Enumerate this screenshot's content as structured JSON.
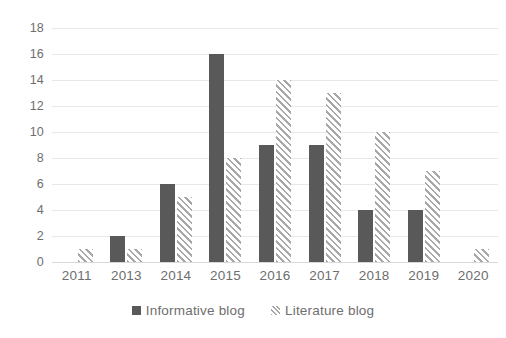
{
  "chart_data": {
    "type": "bar",
    "title": "",
    "xlabel": "",
    "ylabel": "",
    "categories": [
      "2011",
      "2013",
      "2014",
      "2015",
      "2016",
      "2017",
      "2018",
      "2019",
      "2020"
    ],
    "series": [
      {
        "name": "Informative blog",
        "color": "#595959",
        "fill": "solid",
        "values": [
          0,
          2,
          6,
          16,
          9,
          9,
          4,
          4,
          0
        ]
      },
      {
        "name": "Literature blog",
        "color": "#a8a8a8",
        "fill": "diagonal-hatch",
        "values": [
          1,
          1,
          5,
          8,
          14,
          13,
          10,
          7,
          1
        ]
      }
    ],
    "ylim": [
      0,
      18
    ],
    "ytick_step": 2,
    "yticks": [
      "18",
      "16",
      "14",
      "12",
      "10",
      "8",
      "6",
      "4",
      "2",
      "0"
    ],
    "grid": true,
    "legend_position": "bottom",
    "axis_label_color": "#6e6e6e",
    "gridline_color": "#e8e8e8",
    "background_color": "#ffffff"
  }
}
